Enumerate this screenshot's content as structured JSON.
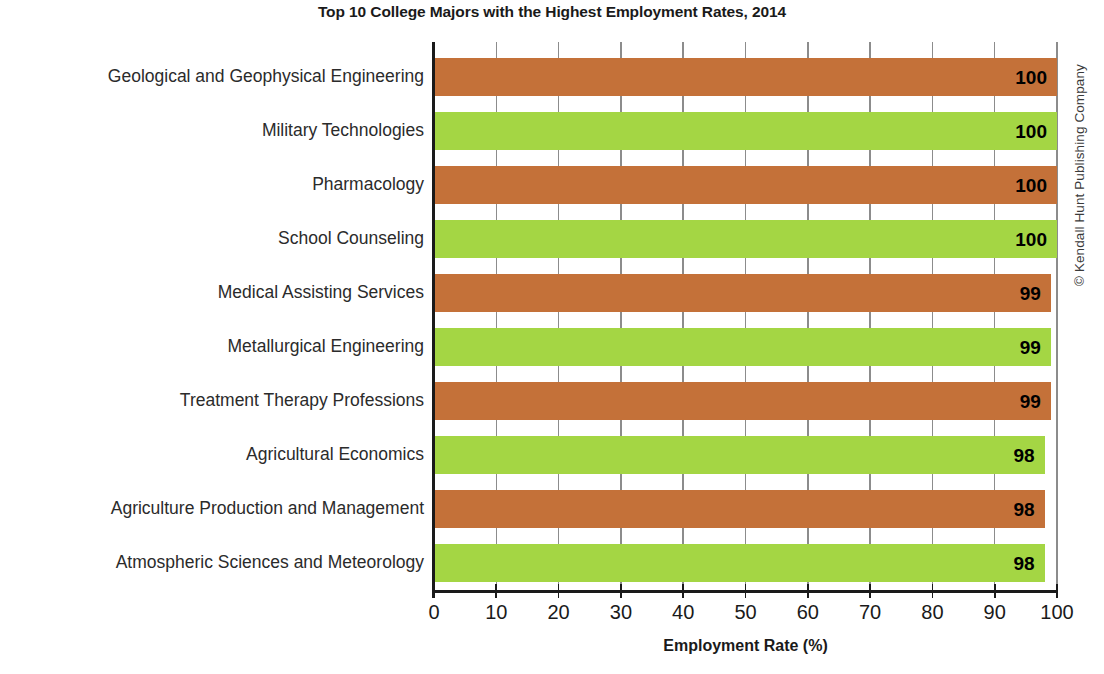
{
  "chart_data": {
    "type": "bar",
    "orientation": "horizontal",
    "title": "Top 10 College Majors with the Highest Employment Rates, 2014",
    "xlabel": "Employment Rate (%)",
    "ylabel": "",
    "xlim": [
      0,
      100
    ],
    "xticks": [
      "0",
      "10",
      "20",
      "30",
      "40",
      "50",
      "60",
      "70",
      "80",
      "90",
      "100"
    ],
    "grid": true,
    "grid_axis": "x",
    "legend": null,
    "categories": [
      "Geological and Geophysical Engineering",
      "Military Technologies",
      "Pharmacology",
      "School Counseling",
      "Medical Assisting Services",
      "Metallurgical Engineering",
      "Treatment Therapy Professions",
      "Agricultural Economics",
      "Agriculture Production and Management",
      "Atmospheric Sciences and Meteorology"
    ],
    "values": [
      100,
      100,
      100,
      100,
      99,
      99,
      99,
      98,
      98,
      98
    ],
    "bar_colors": [
      "#c47139",
      "#a4d644",
      "#c47139",
      "#a4d644",
      "#c47139",
      "#a4d644",
      "#c47139",
      "#a4d644",
      "#c47139",
      "#a4d644"
    ],
    "data_labels": [
      "100",
      "100",
      "100",
      "100",
      "99",
      "99",
      "99",
      "98",
      "98",
      "98"
    ]
  },
  "credit": {
    "text": "© Kendall Hunt Publishing Company"
  },
  "colors": {
    "orange": "#c47139",
    "green": "#a4d644",
    "axis": "#1a1a1a",
    "gridline": "#8c8c8c",
    "label_text": "#2b2b2b"
  }
}
